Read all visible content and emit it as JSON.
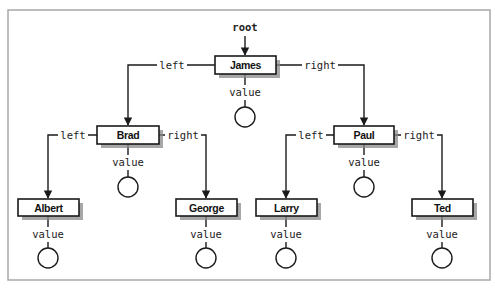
{
  "diagram": {
    "root_label": "root",
    "edge_labels": {
      "left": "left",
      "right": "right",
      "value": "value"
    },
    "nodes": {
      "james": {
        "label": "James",
        "x": 215,
        "y": 56,
        "w": 61,
        "h": 18
      },
      "brad": {
        "label": "Brad",
        "x": 97,
        "y": 126,
        "w": 62,
        "h": 18
      },
      "paul": {
        "label": "Paul",
        "x": 334,
        "y": 126,
        "w": 60,
        "h": 18
      },
      "albert": {
        "label": "Albert",
        "x": 18,
        "y": 199,
        "w": 61,
        "h": 17
      },
      "george": {
        "label": "George",
        "x": 176,
        "y": 199,
        "w": 61,
        "h": 17
      },
      "larry": {
        "label": "Larry",
        "x": 256,
        "y": 199,
        "w": 61,
        "h": 17
      },
      "ted": {
        "label": "Ted",
        "x": 412,
        "y": 199,
        "w": 61,
        "h": 17
      }
    },
    "tree": {
      "label": "James",
      "left": {
        "label": "Brad",
        "left": {
          "label": "Albert"
        },
        "right": {
          "label": "George"
        }
      },
      "right": {
        "label": "Paul",
        "left": {
          "label": "Larry"
        },
        "right": {
          "label": "Ted"
        }
      }
    }
  }
}
